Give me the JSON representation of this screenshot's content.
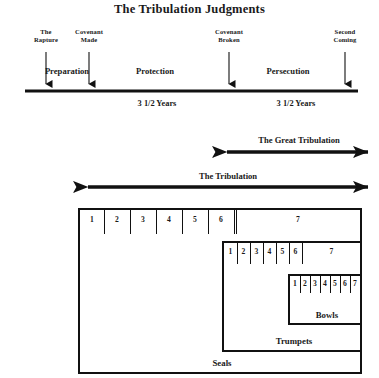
{
  "title": "The Tribulation Judgments",
  "timeline": {
    "events": [
      {
        "name": "rapture",
        "label": "The\nRapture",
        "x": 46,
        "label_top": 28,
        "label_width": 40
      },
      {
        "name": "covenant-made",
        "label": "Covenant\nMade",
        "x": 89,
        "label_top": 28,
        "label_width": 52
      },
      {
        "name": "covenant-broken",
        "label": "Covenant\nBroken",
        "x": 229,
        "label_top": 28,
        "label_width": 56
      },
      {
        "name": "second-coming",
        "label": "Second\nComing",
        "x": 345,
        "label_top": 28,
        "label_width": 48
      }
    ],
    "periods": [
      {
        "name": "preparation",
        "label": "Preparation",
        "x": 67,
        "y": 66
      },
      {
        "name": "protection",
        "label": "Protection",
        "x": 155,
        "y": 66
      },
      {
        "name": "persecution",
        "label": "Persecution",
        "x": 288,
        "y": 66
      }
    ],
    "durations": [
      {
        "name": "first-half",
        "label": "3 1/2 Years",
        "x": 157,
        "y": 99
      },
      {
        "name": "second-half",
        "label": "3 1/2 Years",
        "x": 296,
        "y": 99
      }
    ],
    "line": {
      "x1": 25,
      "x2": 358,
      "y": 91
    }
  },
  "bands": [
    {
      "name": "the-great-tribulation",
      "label": "The Great Tribulation",
      "x1": 227,
      "x2": 368,
      "y": 152,
      "label_y": 136,
      "label_cx": 299
    },
    {
      "name": "the-tribulation",
      "label": "The Tribulation",
      "x1": 88,
      "x2": 368,
      "y": 187,
      "label_y": 172,
      "label_cx": 228
    }
  ],
  "judgments": [
    {
      "name": "seals",
      "caption": "Seals",
      "box": {
        "left": 78,
        "top": 208,
        "width": 284,
        "height": 166
      },
      "row_height": 26,
      "cells": [
        "1",
        "2",
        "3",
        "4",
        "5",
        "6"
      ],
      "wide_cell": "7",
      "cell_width": 26,
      "caption_cx": 222,
      "caption_bottom": 6
    },
    {
      "name": "trumpets",
      "caption": "Trumpets",
      "box": {
        "left": 222,
        "top": 241,
        "width": 140,
        "height": 111
      },
      "row_height": 22,
      "cells": [
        "1",
        "2",
        "3",
        "4",
        "5",
        "6"
      ],
      "wide_cell": "7",
      "cell_width": 13,
      "caption_cx": 292,
      "caption_bottom": 6
    },
    {
      "name": "bowls",
      "caption": "Bowls",
      "box": {
        "left": 288,
        "top": 274,
        "width": 74,
        "height": 51
      },
      "row_height": 18,
      "cells": [
        "1",
        "2",
        "3",
        "4",
        "5",
        "6",
        "7"
      ],
      "wide_cell": null,
      "cell_width": 10,
      "caption_cx": 325,
      "caption_bottom": 5
    }
  ],
  "colors": {
    "ink": "#111111",
    "paper": "#ffffff"
  }
}
